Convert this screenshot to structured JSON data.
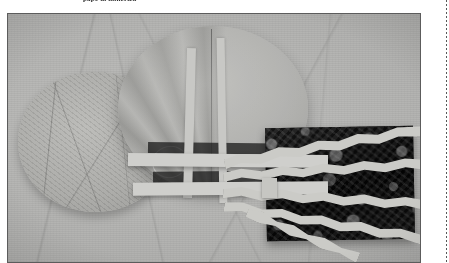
{
  "page": {
    "background_color": "#ffffff",
    "caption": "pape di mincriza",
    "margin_rule": "dashed-vertical-rule"
  },
  "figure": {
    "type": "black-and-white-photograph",
    "frame_border_color": "#5c5c5c",
    "ground_color": "#b2b2b0",
    "dark_panel_color": "#2b2b2b",
    "ribbon_color": "#cbcbc7",
    "elements": [
      {
        "name": "crumpled-paper-disc-left"
      },
      {
        "name": "pleated-fan-disc-center"
      },
      {
        "name": "vertical-paper-strip-1"
      },
      {
        "name": "vertical-paper-strip-2"
      },
      {
        "name": "horizontal-paper-band-1"
      },
      {
        "name": "horizontal-paper-band-2"
      },
      {
        "name": "dark-mottled-panel-right"
      },
      {
        "name": "wavy-ribbon-1"
      },
      {
        "name": "wavy-ribbon-2"
      },
      {
        "name": "wavy-ribbon-3"
      },
      {
        "name": "wavy-ribbon-4"
      },
      {
        "name": "wavy-ribbon-5"
      },
      {
        "name": "ribbon-convergence-hub"
      }
    ]
  }
}
